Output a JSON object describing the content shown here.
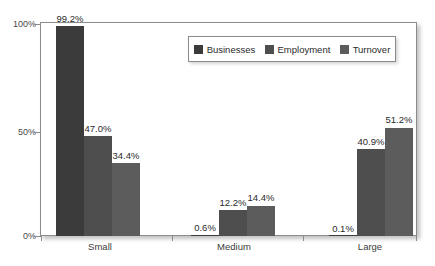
{
  "chart_data": {
    "type": "bar",
    "title": "",
    "subtitle": "",
    "xlabel": "",
    "ylabel": "",
    "categories": [
      "Small",
      "Medium",
      "Large"
    ],
    "series": [
      {
        "name": "Businesses",
        "color": "#3b3b3b",
        "values": [
          99.2,
          0.6,
          0.1
        ],
        "labels": [
          "99.2%",
          "0.6%",
          "0.1%"
        ]
      },
      {
        "name": "Employment",
        "color": "#4e4e4e",
        "values": [
          47.0,
          12.2,
          40.9
        ],
        "labels": [
          "47.0%",
          "12.2%",
          "40.9%"
        ]
      },
      {
        "name": "Turnover",
        "color": "#5c5c5c",
        "values": [
          34.4,
          14.4,
          51.2
        ],
        "labels": [
          "34.4%",
          "14.4%",
          "51.2%"
        ]
      }
    ],
    "ylim": [
      0,
      100
    ],
    "yticks": [
      0,
      50,
      100
    ],
    "ytick_labels": [
      "0%",
      "50%",
      "100%"
    ],
    "grid": false,
    "legend_position": "top-right-inside",
    "value_labels_shown": true
  },
  "axes": {
    "y_tick_0": "0%",
    "y_tick_50": "50%",
    "y_tick_100": "100%",
    "x_cat_0": "Small",
    "x_cat_1": "Medium",
    "x_cat_2": "Large"
  },
  "legend": {
    "entries": [
      {
        "label": "Businesses",
        "swatch": "#3b3b3b"
      },
      {
        "label": "Employment",
        "swatch": "#4e4e4e"
      },
      {
        "label": "Turnover",
        "swatch": "#5c5c5c"
      }
    ]
  },
  "bars": [
    {
      "group": "Small",
      "series": "Businesses",
      "label": "99.2%",
      "value": 99.2
    },
    {
      "group": "Small",
      "series": "Employment",
      "label": "47.0%",
      "value": 47.0
    },
    {
      "group": "Small",
      "series": "Turnover",
      "label": "34.4%",
      "value": 34.4
    },
    {
      "group": "Medium",
      "series": "Businesses",
      "label": "0.6%",
      "value": 0.6
    },
    {
      "group": "Medium",
      "series": "Employment",
      "label": "12.2%",
      "value": 12.2
    },
    {
      "group": "Medium",
      "series": "Turnover",
      "label": "14.4%",
      "value": 14.4
    },
    {
      "group": "Large",
      "series": "Businesses",
      "label": "0.1%",
      "value": 0.1
    },
    {
      "group": "Large",
      "series": "Employment",
      "label": "40.9%",
      "value": 40.9
    },
    {
      "group": "Large",
      "series": "Turnover",
      "label": "51.2%",
      "value": 51.2
    }
  ],
  "colors": {
    "businesses": "#3b3b3b",
    "employment": "#4e4e4e",
    "turnover": "#5c5c5c",
    "axis": "#8c8c8c",
    "text": "#2a2a2a",
    "background": "#ffffff"
  }
}
